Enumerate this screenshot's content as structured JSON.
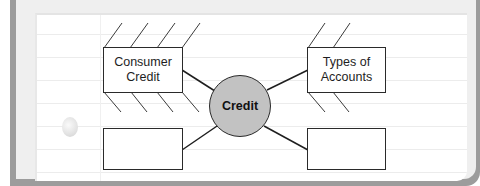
{
  "diagram": {
    "type": "concept-map",
    "center": {
      "label": "Credit",
      "fill": "#c2c2c2"
    },
    "nodes": [
      {
        "position": "top-left",
        "label": "Consumer\nCredit",
        "detail_lines_above": 4,
        "detail_lines_below": 4
      },
      {
        "position": "top-right",
        "label": "Types of\nAccounts",
        "detail_lines_above": 2,
        "detail_lines_below": 2
      },
      {
        "position": "bottom-left",
        "label": ""
      },
      {
        "position": "bottom-right",
        "label": ""
      }
    ]
  },
  "colors": {
    "frame": "#9c9c9c",
    "page": "#ffffff",
    "ruled_line": "#ececec",
    "stroke": "#2a2a2a"
  }
}
